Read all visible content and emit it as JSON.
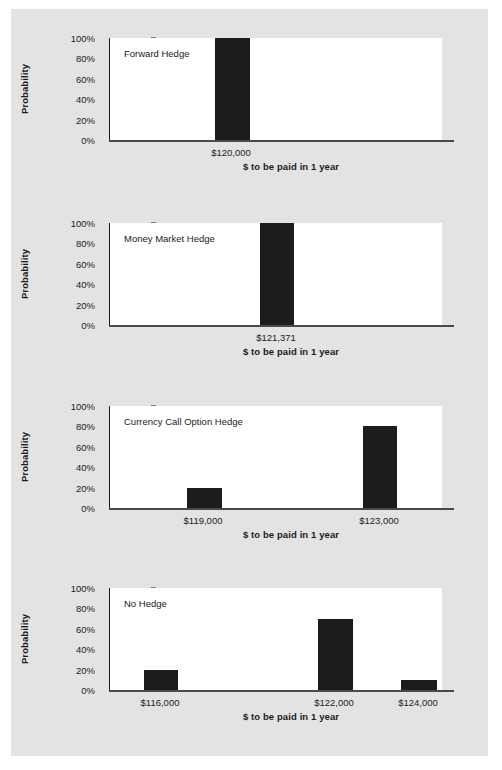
{
  "figure": {
    "background_color": "#e3e3e3",
    "bar_color": "#1c1c1c",
    "axis_color": "#1b1b1b"
  },
  "chart_data": [
    {
      "type": "bar",
      "title": "Forward Hedge",
      "xlabel": "$ to be paid in 1 year",
      "ylabel": "Probability",
      "categories": [
        "$120,000"
      ],
      "values": [
        100
      ],
      "ylim": [
        0,
        100
      ],
      "yticks": [
        "0%",
        "20%",
        "40%",
        "60%",
        "80%",
        "100%"
      ],
      "ytick_values": [
        0,
        20,
        40,
        60,
        80,
        100
      ],
      "grid": false,
      "legend": "none"
    },
    {
      "type": "bar",
      "title": "Money Market Hedge",
      "xlabel": "$ to be paid in 1 year",
      "ylabel": "Probability",
      "categories": [
        "$121,371"
      ],
      "values": [
        100
      ],
      "ylim": [
        0,
        100
      ],
      "yticks": [
        "0%",
        "20%",
        "40%",
        "60%",
        "80%",
        "100%"
      ],
      "ytick_values": [
        0,
        20,
        40,
        60,
        80,
        100
      ],
      "grid": false,
      "legend": "none"
    },
    {
      "type": "bar",
      "title": "Currency Call Option Hedge",
      "xlabel": "$ to be paid in 1 year",
      "ylabel": "Probability",
      "categories": [
        "$119,000",
        "$123,000"
      ],
      "values": [
        20,
        80
      ],
      "ylim": [
        0,
        100
      ],
      "yticks": [
        "0%",
        "20%",
        "40%",
        "60%",
        "80%",
        "100%"
      ],
      "ytick_values": [
        0,
        20,
        40,
        60,
        80,
        100
      ],
      "grid": false,
      "legend": "none"
    },
    {
      "type": "bar",
      "title": "No Hedge",
      "xlabel": "$ to be paid in 1 year",
      "ylabel": "Probability",
      "categories": [
        "$116,000",
        "$122,000",
        "$124,000"
      ],
      "values": [
        20,
        70,
        10
      ],
      "ylim": [
        0,
        100
      ],
      "yticks": [
        "0%",
        "20%",
        "40%",
        "60%",
        "80%",
        "100%"
      ],
      "ytick_values": [
        0,
        20,
        40,
        60,
        80,
        100
      ],
      "grid": false,
      "legend": "none"
    }
  ],
  "layout": {
    "chart_tops": [
      38,
      223,
      406,
      588
    ],
    "bar_geometry": [
      [
        {
          "center": 122,
          "width": 35
        }
      ],
      [
        {
          "center": 167,
          "width": 34
        }
      ],
      [
        {
          "center": 94,
          "width": 35
        },
        {
          "center": 270,
          "width": 34
        }
      ],
      [
        {
          "center": 51,
          "width": 34
        },
        {
          "center": 225,
          "width": 35
        },
        {
          "center": 309,
          "width": 36
        }
      ]
    ],
    "xlabel_centers": [
      280,
      280,
      280,
      280
    ]
  }
}
